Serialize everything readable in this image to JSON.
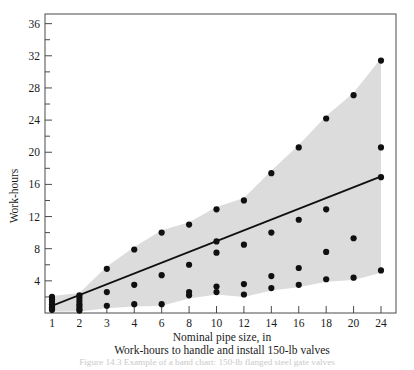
{
  "figure": {
    "caption_line1": "Nominal pipe size, in",
    "caption_line2": "Work-hours to handle and install 150-lb valves",
    "bottom_caption": "Figure 14.3  Example of a band chart: 150-lb flanged steel gate valves",
    "ylabel": "Work-hours"
  },
  "chart_data": {
    "type": "scatter",
    "title": "",
    "subtitle": "",
    "xlabel": "Nominal pipe size, in",
    "ylabel": "Work-hours",
    "xtick_labels": [
      "1",
      "2",
      "3",
      "4",
      "6",
      "8",
      "10",
      "12",
      "14",
      "16",
      "18",
      "20",
      "24"
    ],
    "xtick_values": [
      1,
      2,
      3,
      4,
      6,
      8,
      10,
      12,
      14,
      16,
      18,
      20,
      24
    ],
    "ytick_labels": [
      "4",
      "8",
      "12",
      "16",
      "20",
      "24",
      "28",
      "32",
      "36"
    ],
    "ytick_values": [
      4,
      8,
      12,
      16,
      20,
      24,
      28,
      32,
      36
    ],
    "yminor_values": [
      2,
      6,
      10,
      14,
      18,
      22,
      26,
      30,
      34
    ],
    "ylim": [
      0,
      37.2
    ],
    "xlim_index": [
      0,
      13
    ],
    "grid": false,
    "legend": false,
    "marker": "filled-circle",
    "marker_color": "#101010",
    "band_color": "#dcdcdc",
    "line_color": "#101010",
    "frame_color": "#4a4a4a",
    "points": [
      {
        "x": 1,
        "y": 0.5
      },
      {
        "x": 1,
        "y": 0.7
      },
      {
        "x": 1,
        "y": 0.9
      },
      {
        "x": 1,
        "y": 1.1
      },
      {
        "x": 1,
        "y": 1.4
      },
      {
        "x": 1,
        "y": 1.7
      },
      {
        "x": 1,
        "y": 0.4
      },
      {
        "x": 1,
        "y": 2.0
      },
      {
        "x": 2,
        "y": 0.5
      },
      {
        "x": 2,
        "y": 0.8
      },
      {
        "x": 2,
        "y": 1.1
      },
      {
        "x": 2,
        "y": 1.5
      },
      {
        "x": 2,
        "y": 1.9
      },
      {
        "x": 2,
        "y": 2.2
      },
      {
        "x": 2,
        "y": 0.3
      },
      {
        "x": 3,
        "y": 0.9
      },
      {
        "x": 3,
        "y": 2.6
      },
      {
        "x": 3,
        "y": 5.5
      },
      {
        "x": 4,
        "y": 1.1
      },
      {
        "x": 4,
        "y": 3.5
      },
      {
        "x": 4,
        "y": 7.9
      },
      {
        "x": 6,
        "y": 1.1
      },
      {
        "x": 6,
        "y": 4.7
      },
      {
        "x": 6,
        "y": 10.0
      },
      {
        "x": 8,
        "y": 2.2
      },
      {
        "x": 8,
        "y": 2.6
      },
      {
        "x": 8,
        "y": 6.0
      },
      {
        "x": 8,
        "y": 11.0
      },
      {
        "x": 10,
        "y": 2.6
      },
      {
        "x": 10,
        "y": 3.3
      },
      {
        "x": 10,
        "y": 7.5
      },
      {
        "x": 10,
        "y": 8.9
      },
      {
        "x": 10,
        "y": 12.9
      },
      {
        "x": 12,
        "y": 2.3
      },
      {
        "x": 12,
        "y": 3.6
      },
      {
        "x": 12,
        "y": 8.5
      },
      {
        "x": 12,
        "y": 14.0
      },
      {
        "x": 14,
        "y": 3.1
      },
      {
        "x": 14,
        "y": 4.6
      },
      {
        "x": 14,
        "y": 10.0
      },
      {
        "x": 14,
        "y": 17.4
      },
      {
        "x": 16,
        "y": 3.5
      },
      {
        "x": 16,
        "y": 5.6
      },
      {
        "x": 16,
        "y": 11.6
      },
      {
        "x": 16,
        "y": 20.6
      },
      {
        "x": 18,
        "y": 4.2
      },
      {
        "x": 18,
        "y": 7.6
      },
      {
        "x": 18,
        "y": 12.9
      },
      {
        "x": 18,
        "y": 24.2
      },
      {
        "x": 20,
        "y": 4.4
      },
      {
        "x": 20,
        "y": 9.3
      },
      {
        "x": 20,
        "y": 27.1
      },
      {
        "x": 24,
        "y": 5.3
      },
      {
        "x": 24,
        "y": 16.9
      },
      {
        "x": 24,
        "y": 20.6
      },
      {
        "x": 24,
        "y": 31.4
      }
    ],
    "band_upper": [
      {
        "x": 1,
        "y": 2.1
      },
      {
        "x": 2,
        "y": 2.5
      },
      {
        "x": 3,
        "y": 5.8
      },
      {
        "x": 4,
        "y": 8.2
      },
      {
        "x": 6,
        "y": 10.3
      },
      {
        "x": 8,
        "y": 11.3
      },
      {
        "x": 10,
        "y": 13.2
      },
      {
        "x": 12,
        "y": 14.3
      },
      {
        "x": 14,
        "y": 17.7
      },
      {
        "x": 16,
        "y": 20.9
      },
      {
        "x": 18,
        "y": 24.5
      },
      {
        "x": 20,
        "y": 27.4
      },
      {
        "x": 24,
        "y": 31.7
      }
    ],
    "band_lower": [
      {
        "x": 1,
        "y": 0.2
      },
      {
        "x": 2,
        "y": 0.2
      },
      {
        "x": 3,
        "y": 0.6
      },
      {
        "x": 4,
        "y": 0.8
      },
      {
        "x": 6,
        "y": 0.9
      },
      {
        "x": 8,
        "y": 1.8
      },
      {
        "x": 10,
        "y": 2.3
      },
      {
        "x": 12,
        "y": 2.0
      },
      {
        "x": 14,
        "y": 2.8
      },
      {
        "x": 16,
        "y": 3.2
      },
      {
        "x": 18,
        "y": 3.9
      },
      {
        "x": 20,
        "y": 4.1
      },
      {
        "x": 24,
        "y": 5.0
      }
    ],
    "trend_line": {
      "start": {
        "x": 1,
        "y": 0.9
      },
      "end": {
        "x": 24,
        "y": 17.0
      },
      "label": ""
    }
  }
}
